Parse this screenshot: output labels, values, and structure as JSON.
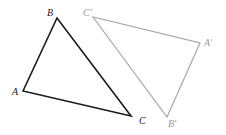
{
  "diagram": {
    "title": "",
    "colors": {
      "original": "#1a1a1a",
      "image": "#a8a8a8",
      "original_label": "#222222",
      "image_label": "#9a9a9a"
    },
    "triangles": [
      {
        "name": "original",
        "vertices": [
          {
            "label": "A",
            "x": 23,
            "y": 91,
            "lx": 12,
            "ly": 95
          },
          {
            "label": "B",
            "x": 57,
            "y": 18,
            "lx": 47,
            "ly": 16
          },
          {
            "label": "C",
            "x": 131,
            "y": 116,
            "lx": 139,
            "ly": 124
          }
        ]
      },
      {
        "name": "image",
        "vertices": [
          {
            "label": "A′",
            "x": 200,
            "y": 43,
            "lx": 204,
            "ly": 46
          },
          {
            "label": "B′",
            "x": 167,
            "y": 117,
            "lx": 168,
            "ly": 127
          },
          {
            "label": "C′",
            "x": 93,
            "y": 17,
            "lx": 83,
            "ly": 16
          }
        ]
      }
    ]
  }
}
